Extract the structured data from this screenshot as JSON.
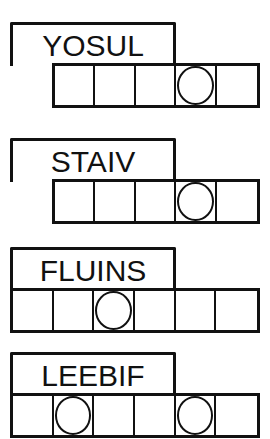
{
  "puzzles": [
    {
      "scrambled": "YOSUL",
      "cells": 5,
      "circled": [
        3
      ],
      "offset_cells": 1
    },
    {
      "scrambled": "STAIV",
      "cells": 5,
      "circled": [
        3
      ],
      "offset_cells": 1
    },
    {
      "scrambled": "FLUINS",
      "cells": 6,
      "circled": [
        2
      ],
      "offset_cells": 0
    },
    {
      "scrambled": "LEEBIF",
      "cells": 6,
      "circled": [
        1,
        4
      ],
      "offset_cells": 0
    }
  ]
}
